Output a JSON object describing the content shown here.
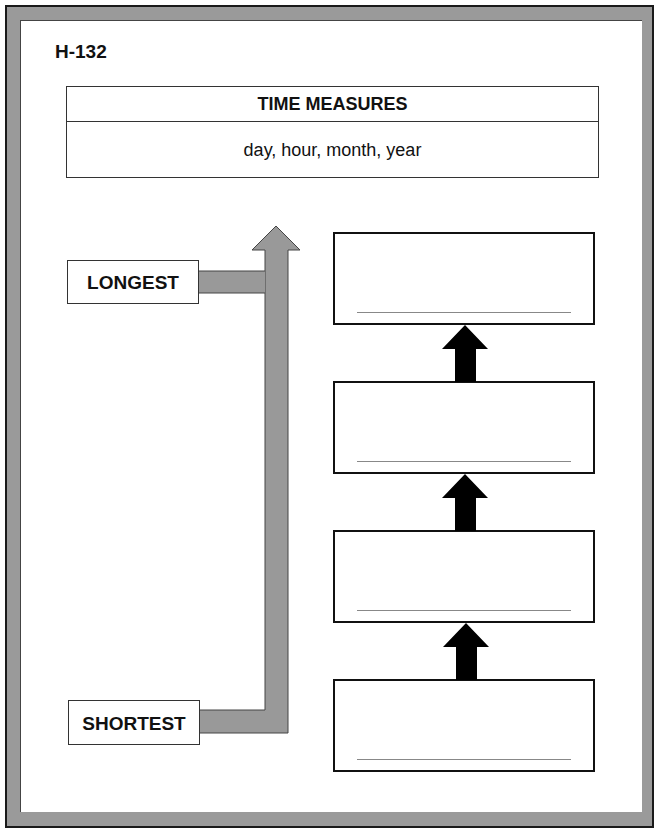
{
  "worksheet": {
    "code": "H-132",
    "title_table": {
      "heading": "TIME MEASURES",
      "words": "day, hour, month, year"
    },
    "scale": {
      "top_label": "LONGEST",
      "bottom_label": "SHORTEST"
    },
    "answer_boxes": [
      {
        "position": 1,
        "value": ""
      },
      {
        "position": 2,
        "value": ""
      },
      {
        "position": 3,
        "value": ""
      },
      {
        "position": 4,
        "value": ""
      }
    ],
    "colors": {
      "frame_gray": "#9a9a9a",
      "scale_arrow_gray": "#999999",
      "step_arrow": "#000000"
    }
  }
}
